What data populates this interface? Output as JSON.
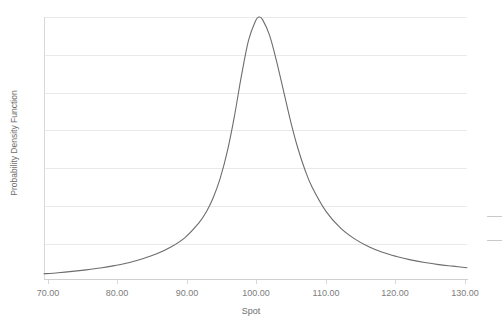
{
  "chart_data": {
    "type": "line",
    "title": "",
    "subtitle": "",
    "xlabel": "Spot",
    "ylabel": "Probability Density Function",
    "xlim": [
      70,
      130
    ],
    "ylim": [
      0,
      1
    ],
    "x_tick_labels": [
      "70.00",
      "80.00",
      "90.00",
      "100.00",
      "110.00",
      "120.00",
      "130.00"
    ],
    "x_tick_values": [
      70,
      80,
      90,
      100,
      110,
      120,
      130
    ],
    "y_tick_labels": [],
    "grid": "horizontal",
    "gridline_count": 8,
    "legend": "none",
    "series": [
      {
        "name": "Probability Density Function",
        "color": "#6d6d6d",
        "x": [
          70,
          72,
          74,
          76,
          78,
          80,
          82,
          84,
          86,
          88,
          90,
          92,
          93,
          94,
          95,
          96,
          97,
          98,
          99,
          100,
          100.5,
          101,
          102,
          103,
          104,
          105,
          106,
          107,
          108,
          110,
          112,
          114,
          116,
          118,
          120,
          122,
          124,
          126,
          128,
          130
        ],
        "values": [
          0.02,
          0.024,
          0.029,
          0.035,
          0.042,
          0.051,
          0.062,
          0.077,
          0.096,
          0.122,
          0.158,
          0.215,
          0.255,
          0.31,
          0.385,
          0.487,
          0.62,
          0.775,
          0.91,
          0.985,
          1.0,
          0.99,
          0.93,
          0.83,
          0.715,
          0.6,
          0.5,
          0.418,
          0.352,
          0.258,
          0.196,
          0.154,
          0.124,
          0.102,
          0.086,
          0.073,
          0.063,
          0.055,
          0.049,
          0.043
        ]
      }
    ]
  },
  "axis": {
    "x_title": "Spot",
    "y_title": "Probability Density Function"
  },
  "colors": {
    "curve": "#6d6d6d",
    "gridline": "#e9e9e9",
    "axis": "#d0d0d0",
    "tick_text": "#7d7d7d",
    "background": "#ffffff"
  }
}
